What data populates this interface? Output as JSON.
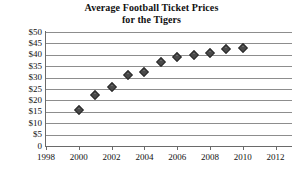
{
  "chart_data": {
    "type": "scatter",
    "title": "Average Football Ticket Prices for the Tigers",
    "title_line1": "Average Football Ticket Prices",
    "title_line2": "for the Tigers",
    "xlabel": "",
    "ylabel": "",
    "xlim": [
      1998,
      2013
    ],
    "ylim": [
      0,
      50
    ],
    "grid": true,
    "legend": "none",
    "marker": "diamond",
    "marker_color": "#4a4a4a",
    "x": [
      2000,
      2001,
      2002,
      2003,
      2004,
      2005,
      2006,
      2007,
      2008,
      2009,
      2010
    ],
    "values": [
      16,
      22.5,
      26,
      31,
      32.5,
      37,
      39,
      40,
      41,
      42.5,
      43
    ],
    "points": [
      {
        "year": 2000,
        "price": 16
      },
      {
        "year": 2001,
        "price": 22.5
      },
      {
        "year": 2002,
        "price": 26
      },
      {
        "year": 2003,
        "price": 31
      },
      {
        "year": 2004,
        "price": 32.5
      },
      {
        "year": 2005,
        "price": 37
      },
      {
        "year": 2006,
        "price": 39
      },
      {
        "year": 2007,
        "price": 40
      },
      {
        "year": 2008,
        "price": 41
      },
      {
        "year": 2009,
        "price": 42.5
      },
      {
        "year": 2010,
        "price": 43
      }
    ],
    "yticks": [
      50,
      45,
      40,
      35,
      30,
      25,
      20,
      15,
      10,
      5,
      0
    ],
    "ytick_labels": [
      "$50",
      "$45",
      "$40",
      "$35",
      "$30",
      "$25",
      "$20",
      "$15",
      "$10",
      "$5",
      "0"
    ],
    "xticks": [
      1998,
      2000,
      2002,
      2004,
      2006,
      2008,
      2010,
      2012
    ],
    "xtick_labels": [
      "1998",
      "2000",
      "2002",
      "2004",
      "2006",
      "2008",
      "2010",
      "2012"
    ]
  }
}
